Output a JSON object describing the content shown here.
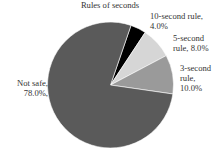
{
  "chart_data": {
    "type": "pie",
    "title": "Rules of seconds",
    "categories": [
      "Not safe",
      "3-second rule",
      "5-second rule",
      "10-second rule"
    ],
    "values": [
      78.0,
      10.0,
      8.0,
      4.0
    ],
    "unit": "%",
    "colors": [
      "#5a5a5a",
      "#9a9a9a",
      "#d6d6d6",
      "#000000"
    ],
    "labels": [
      {
        "line1": "Not safe,",
        "line2": "78.0%,"
      },
      {
        "line1": "3-second",
        "line2": "rule,",
        "line3": "10.0%"
      },
      {
        "line1": "5-second",
        "line2": "rule, 8.0%"
      },
      {
        "line1": "10-second rule,",
        "line2": "4.0%"
      }
    ],
    "legend": "none",
    "grid": false
  }
}
